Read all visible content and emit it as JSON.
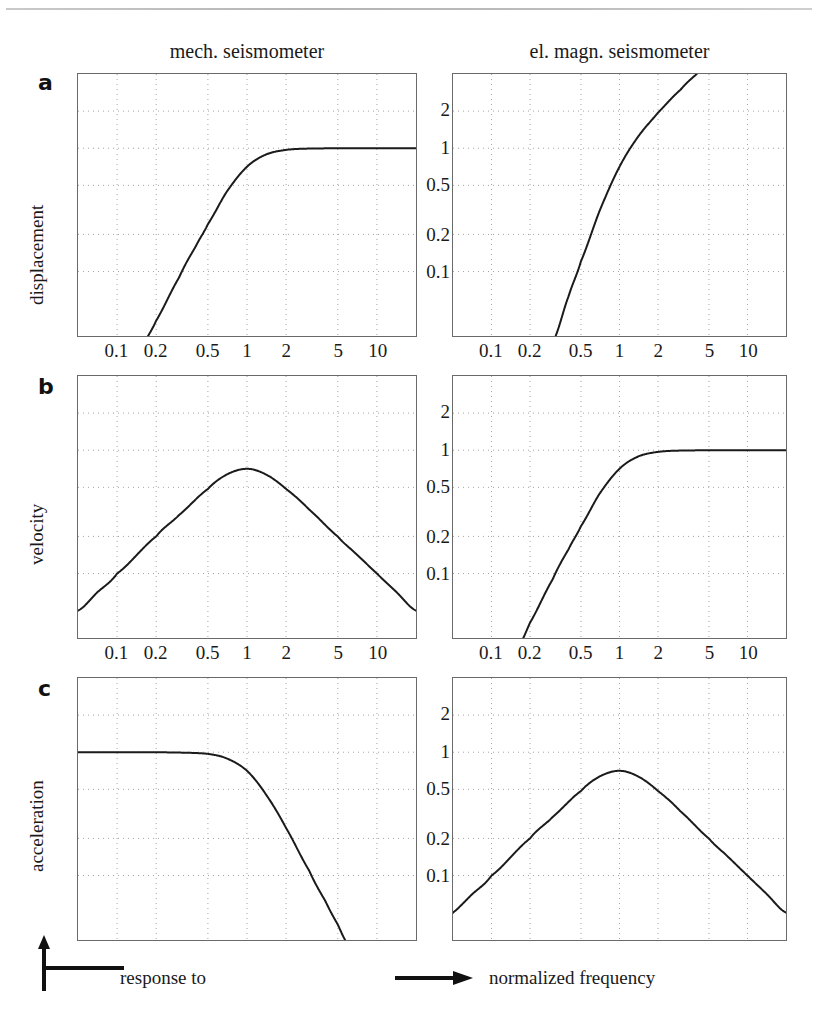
{
  "figure": {
    "column_titles": {
      "left": "mech. seismometer",
      "right": "el. magn. seismometer"
    },
    "panel_labels": {
      "a": "a",
      "b": "b",
      "c": "c"
    },
    "row_ylabels": {
      "a": "displacement",
      "b": "velocity",
      "c": "acceleration"
    },
    "axis_legend": {
      "vertical": "response to",
      "horizontal": "normalized frequency"
    }
  },
  "axes": {
    "x_tick_labels": [
      "0.1",
      "0.2",
      "0.5",
      "1",
      "2",
      "5",
      "10"
    ],
    "x_tick_values": [
      0.1,
      0.2,
      0.5,
      1,
      2,
      5,
      10
    ],
    "x_range": [
      0.05,
      20
    ],
    "y_tick_labels": [
      "2",
      "1",
      "0.5",
      "0.2",
      "0.1"
    ],
    "y_tick_values": [
      2,
      1,
      0.5,
      0.2,
      0.1
    ],
    "y_range": [
      0.03,
      4
    ],
    "x_scale": "log",
    "y_scale": "log",
    "grid": true
  },
  "chart_data": [
    {
      "id": "panel-a-left",
      "type": "line",
      "title": "mech. seismometer - displacement",
      "xlabel": "normalized frequency",
      "ylabel": "displacement",
      "x_scale": "log",
      "y_scale": "log",
      "xlim": [
        0.05,
        20
      ],
      "ylim": [
        0.03,
        4
      ],
      "response": "highpass-2nd-order",
      "damping": 0.707,
      "x": [
        0.05,
        0.07,
        0.1,
        0.15,
        0.2,
        0.3,
        0.4,
        0.5,
        0.7,
        1.0,
        1.4,
        2.0,
        3.0,
        5.0,
        7.0,
        10.0,
        14.0,
        20.0
      ],
      "y": [
        0.0025,
        0.0049,
        0.01,
        0.0225,
        0.04,
        0.0894,
        0.1574,
        0.2425,
        0.4454,
        0.7071,
        0.8893,
        0.9701,
        0.9938,
        0.998,
        0.999,
        0.9995,
        0.9997,
        0.9999
      ]
    },
    {
      "id": "panel-a-right",
      "type": "line",
      "title": "el. magn. seismometer - displacement",
      "xlabel": "normalized frequency",
      "ylabel": "displacement",
      "x_scale": "log",
      "y_scale": "log",
      "xlim": [
        0.05,
        20
      ],
      "ylim": [
        0.03,
        4
      ],
      "response": "highpass-3rd-order",
      "damping": 0.707,
      "x": [
        0.3,
        0.4,
        0.5,
        0.7,
        1.0,
        1.4,
        2.0,
        3.0,
        4.0,
        5.0,
        6.0,
        7.0
      ],
      "y": [
        0.0268,
        0.063,
        0.1213,
        0.3118,
        0.7071,
        1.245,
        1.9403,
        2.9813,
        3.9862,
        4.99,
        5.993,
        6.995
      ]
    },
    {
      "id": "panel-b-left",
      "type": "line",
      "title": "mech. seismometer - velocity",
      "xlabel": "normalized frequency",
      "ylabel": "velocity",
      "x_scale": "log",
      "y_scale": "log",
      "xlim": [
        0.05,
        20
      ],
      "ylim": [
        0.03,
        4
      ],
      "response": "bandpass",
      "peak_x": 1.0,
      "peak_y": 0.707,
      "x": [
        0.05,
        0.07,
        0.1,
        0.2,
        0.3,
        0.5,
        0.7,
        1.0,
        1.4,
        2.0,
        3.0,
        5.0,
        7.0,
        10.0,
        14.0,
        20.0
      ],
      "y": [
        0.05,
        0.07,
        0.1,
        0.2,
        0.2981,
        0.4851,
        0.6363,
        0.7071,
        0.6352,
        0.4851,
        0.3313,
        0.1996,
        0.1427,
        0.0999,
        0.0714,
        0.05
      ]
    },
    {
      "id": "panel-b-right",
      "type": "line",
      "title": "el. magn. seismometer - velocity",
      "xlabel": "normalized frequency",
      "ylabel": "velocity",
      "x_scale": "log",
      "y_scale": "log",
      "xlim": [
        0.05,
        20
      ],
      "ylim": [
        0.03,
        4
      ],
      "response": "highpass-2nd-order",
      "damping": 0.707,
      "x": [
        0.15,
        0.2,
        0.3,
        0.4,
        0.5,
        0.7,
        1.0,
        1.4,
        2.0,
        3.0,
        5.0,
        7.0,
        10.0,
        14.0,
        20.0
      ],
      "y": [
        0.0225,
        0.04,
        0.0894,
        0.1574,
        0.2425,
        0.4454,
        0.7071,
        0.8893,
        0.9701,
        0.9938,
        0.998,
        0.999,
        0.9995,
        0.9997,
        0.9999
      ]
    },
    {
      "id": "panel-c-left",
      "type": "line",
      "title": "mech. seismometer - acceleration",
      "xlabel": "normalized frequency",
      "ylabel": "acceleration",
      "x_scale": "log",
      "y_scale": "log",
      "xlim": [
        0.05,
        20
      ],
      "ylim": [
        0.03,
        4
      ],
      "response": "lowpass-2nd-order",
      "damping": 0.707,
      "x": [
        0.05,
        0.1,
        0.2,
        0.3,
        0.5,
        0.7,
        1.0,
        1.4,
        2.0,
        3.0,
        4.0,
        5.0,
        6.0
      ],
      "y": [
        0.9999,
        0.9995,
        0.998,
        0.9938,
        0.9701,
        0.8893,
        0.7071,
        0.4539,
        0.2425,
        0.1104,
        0.0625,
        0.04,
        0.0278
      ]
    },
    {
      "id": "panel-c-right",
      "type": "line",
      "title": "el. magn. seismometer - acceleration",
      "xlabel": "normalized frequency",
      "ylabel": "acceleration",
      "x_scale": "log",
      "y_scale": "log",
      "xlim": [
        0.05,
        20
      ],
      "ylim": [
        0.03,
        4
      ],
      "response": "bandpass",
      "peak_x": 1.0,
      "peak_y": 0.707,
      "x": [
        0.04,
        0.05,
        0.07,
        0.1,
        0.2,
        0.3,
        0.5,
        0.7,
        1.0,
        1.4,
        2.0,
        3.0,
        5.0,
        7.0,
        10.0,
        14.0,
        20.0
      ],
      "y": [
        0.04,
        0.05,
        0.07,
        0.1,
        0.2,
        0.2981,
        0.4851,
        0.6363,
        0.7071,
        0.6352,
        0.4851,
        0.3313,
        0.1996,
        0.1427,
        0.0999,
        0.0714,
        0.05
      ]
    }
  ]
}
